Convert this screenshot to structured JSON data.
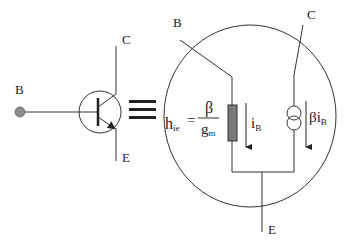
{
  "diagram": {
    "symbol": {
      "base_label": "B",
      "collector_label": "C",
      "emitter_label": "E"
    },
    "equivalence_symbol": "≡",
    "equivalent_circuit": {
      "base_label": "B",
      "collector_label": "C",
      "emitter_label": "E",
      "resistor_equation": {
        "lhs": "h",
        "lhs_sub": "ie",
        "equals": "=",
        "numerator": "β",
        "denominator": "g",
        "denominator_sub": "m"
      },
      "base_current": {
        "symbol": "i",
        "sub": "B"
      },
      "source_current": {
        "prefix": "βi",
        "sub": "B"
      }
    },
    "colors": {
      "line": "#333333",
      "resistor_fill": "#7a7a7a",
      "node_fill": "#8c8c8c"
    }
  }
}
